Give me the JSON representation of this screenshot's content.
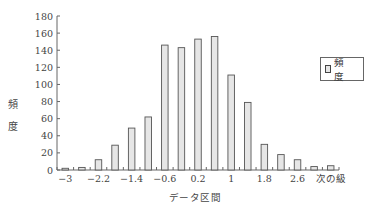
{
  "chart_data": {
    "type": "bar",
    "title": "",
    "xlabel": "データ区間",
    "ylabel": "頻度",
    "ylim": [
      0,
      180
    ],
    "yticks": [
      0,
      20,
      40,
      60,
      80,
      100,
      120,
      140,
      160,
      180
    ],
    "categories": [
      "-3",
      "-2.6",
      "-2.2",
      "-1.8",
      "-1.4",
      "-1",
      "-0.6",
      "-0.2",
      "0.2",
      "0.6",
      "1",
      "1.4",
      "1.8",
      "2.2",
      "2.6",
      "3",
      "次の級"
    ],
    "visible_xtick_labels": [
      "-3",
      "-2.2",
      "-1.4",
      "-0.6",
      "0.2",
      "1",
      "1.8",
      "2.6",
      "次の級"
    ],
    "series": [
      {
        "name": "頻度",
        "values": [
          2,
          3,
          12,
          29,
          49,
          62,
          146,
          143,
          153,
          156,
          111,
          79,
          30,
          18,
          12,
          4,
          5
        ]
      }
    ],
    "legend": {
      "position": "right",
      "entries": [
        "頻　度"
      ]
    },
    "grid": false,
    "bar_fill": "#e6e6e6",
    "bar_stroke": "#555555"
  },
  "labels": {
    "ylabel_chars": [
      "頻",
      "度"
    ],
    "xlabel": "データ区間",
    "legend": "頻 度"
  }
}
